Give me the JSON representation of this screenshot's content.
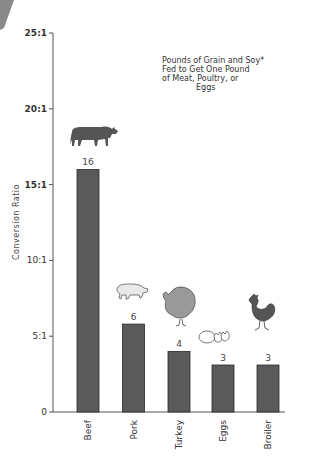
{
  "chart_data": {
    "type": "bar",
    "title_lines": [
      "Pounds of Grain and Soy*",
      "Fed to Get One Pound",
      "of Meat, Poultry, or",
      "Eggs"
    ],
    "xlabel": "",
    "ylabel": "Conversion Ratio",
    "ylim": [
      0,
      25
    ],
    "yticks": [
      0,
      5,
      10,
      15,
      20,
      25
    ],
    "ytick_labels": [
      "0",
      "5:1",
      "10:1",
      "15:1",
      "20:1",
      "25:1"
    ],
    "categories": [
      "Beef",
      "Pork",
      "Turkey",
      "Eggs",
      "Broiler"
    ],
    "values": [
      16,
      6,
      4,
      3,
      3
    ],
    "value_labels": [
      "16",
      "6",
      "4",
      "3",
      "3"
    ],
    "plotted_heights": [
      16,
      5.8,
      4,
      3.1,
      3.1
    ],
    "icons": [
      "cow-icon",
      "pig-icon",
      "turkey-icon",
      "eggs-icon",
      "rooster-icon"
    ],
    "grid": false,
    "legend": "none",
    "colors": {
      "bar": "#5a5a5a",
      "bar_edge": "#2a2a2a",
      "axis": "#555555",
      "cow": "#555555",
      "pig": "#e8e8e8",
      "turkey": "#9a9a9a",
      "rooster": "#555555",
      "corner": "#8a8a8a"
    }
  }
}
